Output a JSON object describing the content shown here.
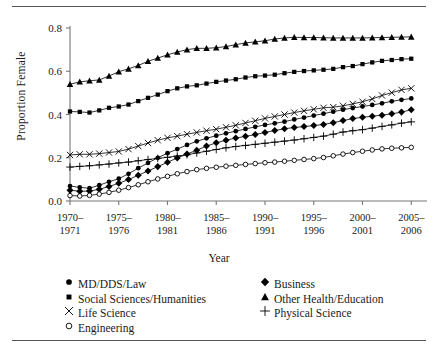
{
  "figure": {
    "axis": {
      "ylabel": "Proportion Female",
      "xlabel": "Year",
      "y_ticks": [
        "0.0",
        "0.2",
        "0.4",
        "0.6",
        "0.8"
      ],
      "x_ticks": [
        {
          "line1": "1970–",
          "line2": "1971"
        },
        {
          "line1": "1975–",
          "line2": "1976"
        },
        {
          "line1": "1980–",
          "line2": "1981"
        },
        {
          "line1": "1985–",
          "line2": "1986"
        },
        {
          "line1": "1990–",
          "line2": "1991"
        },
        {
          "line1": "1995–",
          "line2": "1996"
        },
        {
          "line1": "2000–",
          "line2": "2001"
        },
        {
          "line1": "2005–",
          "line2": "2006"
        }
      ]
    },
    "legend": {
      "left": [
        {
          "label": "MD/DDS/Law",
          "marker": "filled-circle-icon"
        },
        {
          "label": "Social Sciences/Humanities",
          "marker": "filled-square-icon"
        },
        {
          "label": "Life Science",
          "marker": "cross-x-icon"
        },
        {
          "label": "Engineering",
          "marker": "open-circle-icon"
        }
      ],
      "right": [
        {
          "label": "Business",
          "marker": "filled-diamond-icon"
        },
        {
          "label": "Other Health/Education",
          "marker": "filled-triangle-icon"
        },
        {
          "label": "Physical Science",
          "marker": "plus-icon"
        }
      ]
    }
  },
  "chart_data": {
    "type": "line",
    "title": "",
    "subtitle": "",
    "xlabel": "Year",
    "ylabel": "Proportion Female",
    "xlim": [
      1970,
      2005
    ],
    "ylim": [
      0.0,
      0.8
    ],
    "grid": false,
    "legend_position": "below-plot-two-columns",
    "x_tick_labels": [
      "1970–1971",
      "1975–1976",
      "1980–1981",
      "1985–1986",
      "1990–1991",
      "1995–1996",
      "2000–2001",
      "2005–2006"
    ],
    "x_tick_values": [
      1970,
      1975,
      1980,
      1985,
      1990,
      1995,
      2000,
      2005
    ],
    "y_tick_values": [
      0.0,
      0.2,
      0.4,
      0.6,
      0.8
    ],
    "x": [
      1970,
      1971,
      1972,
      1973,
      1974,
      1975,
      1976,
      1977,
      1978,
      1979,
      1980,
      1981,
      1982,
      1983,
      1984,
      1985,
      1986,
      1987,
      1988,
      1989,
      1990,
      1991,
      1992,
      1993,
      1994,
      1995,
      1996,
      1997,
      1998,
      1999,
      2000,
      2001,
      2002,
      2003,
      2004,
      2005
    ],
    "series": [
      {
        "name": "Other Health/Education",
        "marker": "filled-triangle-icon",
        "values": [
          0.54,
          0.551,
          0.556,
          0.56,
          0.578,
          0.598,
          0.611,
          0.627,
          0.646,
          0.661,
          0.676,
          0.689,
          0.7,
          0.706,
          0.706,
          0.709,
          0.714,
          0.723,
          0.731,
          0.736,
          0.741,
          0.749,
          0.754,
          0.757,
          0.756,
          0.756,
          0.755,
          0.754,
          0.754,
          0.754,
          0.754,
          0.755,
          0.756,
          0.757,
          0.758,
          0.759
        ]
      },
      {
        "name": "Social Sciences/Humanities",
        "marker": "filled-square-icon",
        "values": [
          0.414,
          0.412,
          0.409,
          0.419,
          0.431,
          0.437,
          0.446,
          0.462,
          0.477,
          0.492,
          0.508,
          0.521,
          0.53,
          0.535,
          0.543,
          0.551,
          0.557,
          0.563,
          0.571,
          0.577,
          0.58,
          0.584,
          0.591,
          0.597,
          0.601,
          0.604,
          0.607,
          0.611,
          0.619,
          0.624,
          0.633,
          0.641,
          0.648,
          0.652,
          0.656,
          0.658
        ]
      },
      {
        "name": "Life Science",
        "marker": "cross-x-icon",
        "values": [
          0.213,
          0.216,
          0.216,
          0.219,
          0.224,
          0.229,
          0.24,
          0.254,
          0.268,
          0.281,
          0.292,
          0.3,
          0.309,
          0.317,
          0.325,
          0.332,
          0.341,
          0.35,
          0.361,
          0.371,
          0.382,
          0.391,
          0.4,
          0.409,
          0.417,
          0.424,
          0.431,
          0.434,
          0.44,
          0.449,
          0.459,
          0.472,
          0.488,
          0.501,
          0.514,
          0.521
        ]
      },
      {
        "name": "MD/DDS/Law",
        "marker": "filled-circle-icon",
        "values": [
          0.069,
          0.063,
          0.059,
          0.073,
          0.089,
          0.103,
          0.126,
          0.152,
          0.176,
          0.2,
          0.221,
          0.24,
          0.259,
          0.276,
          0.29,
          0.302,
          0.313,
          0.323,
          0.333,
          0.343,
          0.352,
          0.359,
          0.367,
          0.377,
          0.386,
          0.395,
          0.404,
          0.413,
          0.422,
          0.43,
          0.437,
          0.444,
          0.452,
          0.461,
          0.468,
          0.474
        ]
      },
      {
        "name": "Business",
        "marker": "filled-diamond-icon",
        "values": [
          0.05,
          0.045,
          0.046,
          0.054,
          0.067,
          0.082,
          0.099,
          0.119,
          0.139,
          0.159,
          0.179,
          0.199,
          0.217,
          0.235,
          0.254,
          0.269,
          0.281,
          0.291,
          0.299,
          0.307,
          0.317,
          0.326,
          0.334,
          0.34,
          0.344,
          0.349,
          0.354,
          0.362,
          0.372,
          0.381,
          0.387,
          0.392,
          0.397,
          0.403,
          0.411,
          0.422
        ]
      },
      {
        "name": "Physical Science",
        "marker": "plus-icon",
        "values": [
          0.157,
          0.16,
          0.163,
          0.167,
          0.171,
          0.176,
          0.18,
          0.186,
          0.192,
          0.197,
          0.202,
          0.208,
          0.214,
          0.222,
          0.23,
          0.238,
          0.246,
          0.252,
          0.257,
          0.262,
          0.267,
          0.272,
          0.277,
          0.282,
          0.288,
          0.294,
          0.3,
          0.309,
          0.319,
          0.325,
          0.33,
          0.337,
          0.345,
          0.352,
          0.36,
          0.366
        ]
      },
      {
        "name": "Engineering",
        "marker": "open-circle-icon",
        "values": [
          0.025,
          0.023,
          0.026,
          0.032,
          0.04,
          0.05,
          0.062,
          0.075,
          0.089,
          0.102,
          0.114,
          0.126,
          0.136,
          0.145,
          0.151,
          0.156,
          0.161,
          0.165,
          0.169,
          0.173,
          0.177,
          0.18,
          0.184,
          0.188,
          0.192,
          0.196,
          0.201,
          0.209,
          0.217,
          0.224,
          0.23,
          0.236,
          0.241,
          0.244,
          0.246,
          0.248
        ]
      }
    ]
  }
}
